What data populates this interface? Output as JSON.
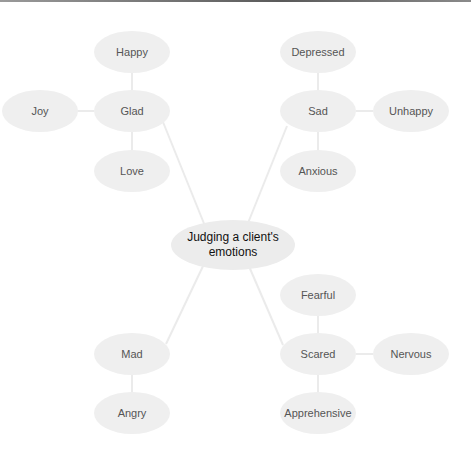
{
  "diagram": {
    "type": "mind-map",
    "colors": {
      "node_fill": "#efefef",
      "edge": "#ebebeb",
      "text": "#555555",
      "center_text": "#111111"
    },
    "center": {
      "label": "Judging a client's emotions",
      "x": 233,
      "y": 245
    },
    "nodes": [
      {
        "id": "glad",
        "label": "Glad",
        "x": 132,
        "y": 111
      },
      {
        "id": "happy",
        "label": "Happy",
        "x": 132,
        "y": 52
      },
      {
        "id": "joy",
        "label": "Joy",
        "x": 40,
        "y": 111
      },
      {
        "id": "love",
        "label": "Love",
        "x": 132,
        "y": 171
      },
      {
        "id": "sad",
        "label": "Sad",
        "x": 318,
        "y": 111
      },
      {
        "id": "depressed",
        "label": "Depressed",
        "x": 318,
        "y": 52
      },
      {
        "id": "unhappy",
        "label": "Unhappy",
        "x": 411,
        "y": 111
      },
      {
        "id": "anxious",
        "label": "Anxious",
        "x": 318,
        "y": 171
      },
      {
        "id": "mad",
        "label": "Mad",
        "x": 132,
        "y": 354
      },
      {
        "id": "angry",
        "label": "Angry",
        "x": 132,
        "y": 413
      },
      {
        "id": "scared",
        "label": "Scared",
        "x": 318,
        "y": 354
      },
      {
        "id": "fearful",
        "label": "Fearful",
        "x": 318,
        "y": 295
      },
      {
        "id": "nervous",
        "label": "Nervous",
        "x": 411,
        "y": 354
      },
      {
        "id": "apprehensive",
        "label": "Apprehensive",
        "x": 318,
        "y": 413
      }
    ],
    "edges": [
      [
        "center",
        "glad"
      ],
      [
        "center",
        "sad"
      ],
      [
        "center",
        "mad"
      ],
      [
        "center",
        "scared"
      ],
      [
        "glad",
        "happy"
      ],
      [
        "glad",
        "joy"
      ],
      [
        "glad",
        "love"
      ],
      [
        "sad",
        "depressed"
      ],
      [
        "sad",
        "unhappy"
      ],
      [
        "sad",
        "anxious"
      ],
      [
        "mad",
        "angry"
      ],
      [
        "scared",
        "fearful"
      ],
      [
        "scared",
        "nervous"
      ],
      [
        "scared",
        "apprehensive"
      ]
    ]
  }
}
